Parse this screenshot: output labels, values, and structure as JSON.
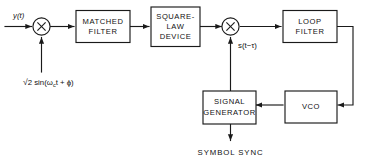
{
  "diagram": {
    "blocks": [
      {
        "id": "matched_filter",
        "label_lines": [
          "MATCHED",
          "FILTER"
        ]
      },
      {
        "id": "square_law",
        "label_lines": [
          "SQUARE-",
          "LAW",
          "DEVICE"
        ]
      },
      {
        "id": "loop_filter",
        "label_lines": [
          "LOOP",
          "FILTER"
        ]
      },
      {
        "id": "vco",
        "label_lines": [
          "VCO"
        ]
      },
      {
        "id": "signal_generator",
        "label_lines": [
          "SIGNAL",
          "GENERATOR"
        ]
      }
    ],
    "multipliers": [
      {
        "id": "input_mixer",
        "symbol": "×"
      },
      {
        "id": "loop_mixer",
        "symbol": "×"
      }
    ],
    "signals": {
      "input": "y(t)",
      "local_oscillator_radical": "√",
      "local_oscillator": "2 sin(ω",
      "local_oscillator_sub": "c",
      "local_oscillator_tail": "t + ϕ)",
      "delayed_reference": "s(t−τ)",
      "output": "SYMBOL  SYNC"
    },
    "colors": {
      "line": "#1a1a1a",
      "background": "#ffffff",
      "text": "#111111"
    }
  }
}
